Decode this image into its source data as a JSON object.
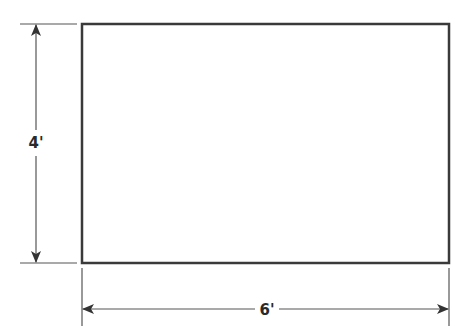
{
  "diagram": {
    "shape": "rectangle",
    "width_label": "6'",
    "height_label": "4'",
    "colors": {
      "stroke": "#3a3a3a",
      "dimension_line": "#555555",
      "background": "#ffffff"
    }
  }
}
